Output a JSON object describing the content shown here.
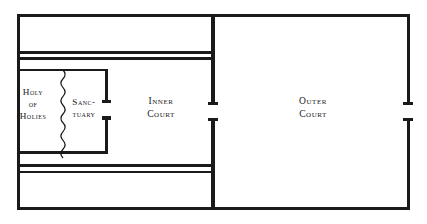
{
  "figure": {
    "kind": "architectural-floor-plan",
    "background_color": "#ffffff",
    "line_color": "#1a1a1a",
    "text_color": "#1a1a1a"
  },
  "rooms": {
    "holy_of_holies": {
      "name": "Holy of Holies",
      "lines": [
        "Holy",
        "of",
        "Holies"
      ]
    },
    "sanctuary": {
      "name": "Sanctuary",
      "lines": [
        "Sanc-",
        "tuary"
      ]
    },
    "inner_court": {
      "name": "Inner Court",
      "lines": [
        "Inner",
        "Court"
      ]
    },
    "outer_court": {
      "name": "Outer Court",
      "lines": [
        "Outer",
        "Court"
      ]
    }
  },
  "features": {
    "veil": {
      "name": "veil-curtain",
      "description": "wavy vertical line dividing Holy of Holies from Sanctuary"
    },
    "gates": [
      {
        "name": "sanctuary-entrance-gate",
        "wall": "sanctuary-east-wall"
      },
      {
        "name": "inner-court-gate",
        "wall": "inner-court-east-wall"
      },
      {
        "name": "outer-court-gate",
        "wall": "outer-court-east-wall"
      }
    ],
    "chambers": [
      {
        "name": "north-chamber-band"
      },
      {
        "name": "south-chamber-band"
      }
    ]
  },
  "geometry": {
    "outer_wall": {
      "x": 17,
      "y": 14,
      "width": 393,
      "height": 196
    },
    "inner_outer_divider_x": 212,
    "north_band_y": 52,
    "south_band_y": 168,
    "sanctuary_block": {
      "x": 17,
      "y": 69,
      "width": 88,
      "height": 84
    },
    "veil_x": 63
  }
}
